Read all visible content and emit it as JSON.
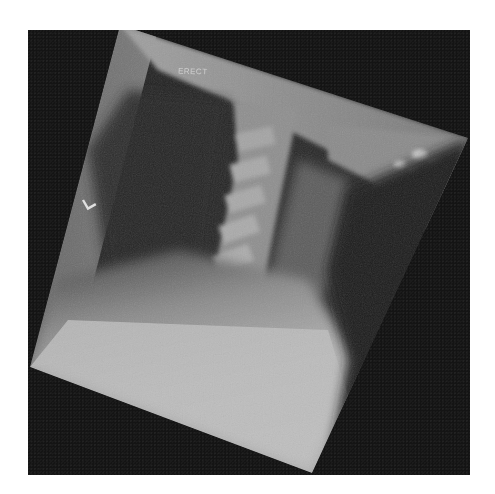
{
  "image": {
    "description": "Lateral cervical spine radiograph, rotated within a dark frame",
    "position_label": "ERECT",
    "side_marker": "L",
    "colors": {
      "background": "#ffffff",
      "frame": "#141414",
      "soft_tissue_dark": "#2a2a2a",
      "bone_light": "#bdbdbd",
      "shoulder_bright": "#b8b8b8"
    }
  }
}
